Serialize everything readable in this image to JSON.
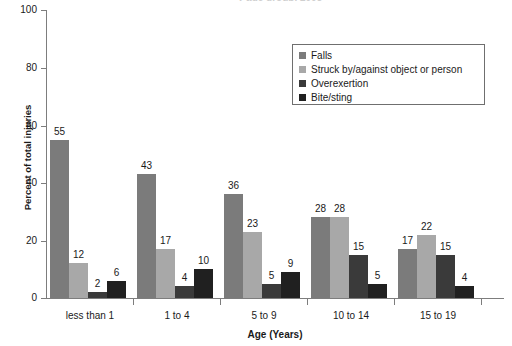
{
  "chart_data": {
    "type": "bar",
    "title_visible_fragment": "y age group, 2003",
    "xlabel": "Age (Years)",
    "ylabel": "Percent of total injuries",
    "categories": [
      "less than 1",
      "1 to 4",
      "5 to 9",
      "10 to 14",
      "15 to 19"
    ],
    "ylim": [
      0,
      100
    ],
    "yticks": [
      0,
      20,
      40,
      60,
      80,
      100
    ],
    "grid": false,
    "legend_position": "upper right",
    "series": [
      {
        "name": "Falls",
        "color": "#7b7b7b",
        "values": [
          55,
          43,
          36,
          28,
          17
        ]
      },
      {
        "name": "Struck by/against object or person",
        "color": "#a8a8a8",
        "values": [
          12,
          17,
          23,
          28,
          22
        ]
      },
      {
        "name": "Overexertion",
        "color": "#3a3a3a",
        "values": [
          2,
          4,
          5,
          15,
          15
        ]
      },
      {
        "name": "Bite/sting",
        "color": "#202020",
        "values": [
          6,
          10,
          9,
          5,
          4
        ]
      }
    ]
  },
  "axis": {
    "y_tick_labels": [
      "0",
      "20",
      "40",
      "60",
      "80",
      "100"
    ],
    "x_tick_labels": [
      "less than 1",
      "1 to 4",
      "5 to 9",
      "10 to 14",
      "15 to 19"
    ],
    "y_title": "Percent of total injuries",
    "x_title": "Age (Years)"
  },
  "legend": {
    "items": [
      {
        "label": "Falls"
      },
      {
        "label": "Struck by/against object or person"
      },
      {
        "label": "Overexertion"
      },
      {
        "label": "Bite/sting"
      }
    ]
  },
  "value_labels": {
    "g0": [
      "55",
      "12",
      "2",
      "6"
    ],
    "g1": [
      "43",
      "17",
      "4",
      "10"
    ],
    "g2": [
      "36",
      "23",
      "5",
      "9"
    ],
    "g3": [
      "28",
      "28",
      "15",
      "5"
    ],
    "g4": [
      "17",
      "22",
      "15",
      "4"
    ]
  }
}
